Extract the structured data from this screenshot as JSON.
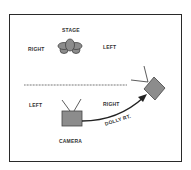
{
  "diagram": {
    "type": "camera-blocking",
    "stage": {
      "title": "STAGE",
      "right_label": "RIGHT",
      "left_label": "LEFT"
    },
    "camera_area": {
      "left_label": "LEFT",
      "right_label": "RIGHT",
      "camera_label": "CAMERA",
      "move_label": "DOLLY RT."
    },
    "divider": "dotted",
    "colors": {
      "frame": "#2a2a2a",
      "fill": "#8c8c8c",
      "text": "#333333"
    }
  }
}
